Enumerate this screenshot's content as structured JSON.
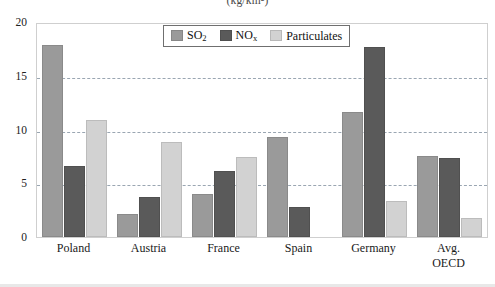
{
  "chart_data": {
    "type": "bar",
    "title": "(kg/km²)",
    "xlabel": "",
    "ylabel": "",
    "ylim": [
      0,
      20
    ],
    "yticks": [
      0,
      5,
      10,
      15,
      20
    ],
    "ytick_labels": [
      "0",
      "5",
      "10",
      "15",
      "20"
    ],
    "grid": true,
    "grid_style": "dashed-horizontal",
    "legend_position": "top-center-inside",
    "categories": [
      "Poland",
      "Austria",
      "France",
      "Spain",
      "Germany",
      "Avg.\nOECD"
    ],
    "category_labels_plain": [
      "Poland",
      "Austria",
      "France",
      "Spain",
      "Germany",
      "Avg. OECD"
    ],
    "series": [
      {
        "name": "SO2",
        "label_html": "SO₂",
        "color": "#9a9a9a",
        "values": [
          18.0,
          2.2,
          4.0,
          9.4,
          11.7,
          7.6
        ]
      },
      {
        "name": "NOx",
        "label_html": "NOₓ",
        "color": "#5a5a5a",
        "values": [
          6.7,
          3.8,
          6.2,
          2.8,
          17.8,
          7.4
        ]
      },
      {
        "name": "Particulates",
        "label_html": "Particulates",
        "color": "#d2d2d2",
        "values": [
          11.0,
          8.9,
          7.5,
          0,
          3.4,
          1.8
        ]
      }
    ]
  },
  "legend": {
    "items": [
      {
        "label": "SO",
        "sub": "2",
        "swatch": "#9a9a9a"
      },
      {
        "label": "NO",
        "sub": "x",
        "swatch": "#5a5a5a"
      },
      {
        "label": "Particulates",
        "sub": "",
        "swatch": "#d2d2d2"
      }
    ]
  },
  "colors": {
    "so2": "#9a9a9a",
    "nox": "#5a5a5a",
    "particulates": "#d2d2d2",
    "gridline": "#9aa6b2",
    "frame": "#cfcfcf",
    "text": "#1a1a1a"
  }
}
